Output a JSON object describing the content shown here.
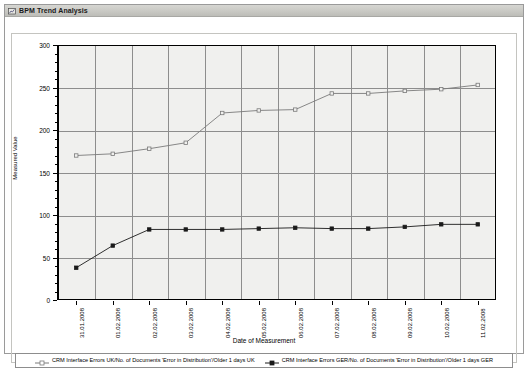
{
  "window": {
    "title": "BPM Trend Analysis",
    "icon": "chart-window-icon"
  },
  "chart_data": {
    "type": "line",
    "title": "BPM Trend Analysis",
    "xlabel": "Date of Measurement",
    "ylabel": "Measured Value",
    "ylim": [
      0,
      300
    ],
    "ytick_step": 50,
    "yticks": [
      "0",
      "50",
      "100",
      "150",
      "200",
      "250",
      "300"
    ],
    "grid": true,
    "legend_position": "bottom",
    "categories": [
      "31.01.2008",
      "01.02.2008",
      "02.02.2008",
      "03.02.2008",
      "04.02.2008",
      "05.02.2008",
      "06.02.2008",
      "07.02.2008",
      "08.02.2008",
      "09.02.2008",
      "10.02.2008",
      "11.02.2008"
    ],
    "series": [
      {
        "name": "CRM Interface Errors UK/No. of Documents 'Error in Distribution'/Older 1 days UK",
        "color": "#7a7a7a",
        "marker": "square-open",
        "values": [
          170,
          172,
          178,
          185,
          220,
          223,
          224,
          243,
          243,
          246,
          248,
          253
        ]
      },
      {
        "name": "CRM Interface Errors GER/No. of Documents 'Error in Distribution'/Older 1 days GER",
        "color": "#1a1a1a",
        "marker": "square-filled",
        "values": [
          38,
          64,
          83,
          83,
          83,
          84,
          85,
          84,
          84,
          86,
          89,
          89
        ]
      }
    ]
  }
}
